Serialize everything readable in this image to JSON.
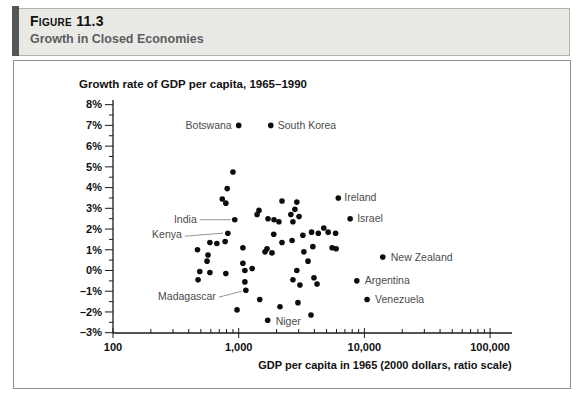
{
  "figure_header": {
    "label": "Figure 11.3",
    "title": "Growth in Closed Economies"
  },
  "colors": {
    "header_bg": "#e9e9e6",
    "header_accent": "#55565a",
    "header_title_text": "#5c5d5f",
    "frame_border": "#8f8f8f",
    "dot": "#0d0d0d",
    "country_label": "#4b4b4b",
    "leader_line": "#8a8a8a",
    "axis": "#1a1a1a"
  },
  "chart_data": {
    "type": "scatter",
    "title": "Growth rate of GDP per capita, 1965–1990",
    "xlabel": "GDP per capita in 1965 (2000 dollars, ratio scale)",
    "ylabel": "",
    "x_scale": "log",
    "xlim": [
      100,
      100000
    ],
    "ylim": [
      -3,
      8
    ],
    "grid": false,
    "x_ticks": [
      {
        "value": 100,
        "label": "100"
      },
      {
        "value": 1000,
        "label": "1,000"
      },
      {
        "value": 10000,
        "label": "10,000"
      },
      {
        "value": 100000,
        "label": "100,000"
      }
    ],
    "y_ticks": [
      {
        "value": 8,
        "label": "8%"
      },
      {
        "value": 7,
        "label": "7%"
      },
      {
        "value": 6,
        "label": "6%"
      },
      {
        "value": 5,
        "label": "5%"
      },
      {
        "value": 4,
        "label": "4%"
      },
      {
        "value": 3,
        "label": "3%"
      },
      {
        "value": 2,
        "label": "2%"
      },
      {
        "value": 1,
        "label": "1%"
      },
      {
        "value": 0,
        "label": "0%"
      },
      {
        "value": -1,
        "label": "–1%"
      },
      {
        "value": -2,
        "label": "–2%"
      },
      {
        "value": -3,
        "label": "–3%"
      }
    ],
    "y_minor_step": 0.5,
    "labeled_points": [
      {
        "label": "Botswana",
        "gdp": 1000,
        "growth": 7.0,
        "side": "left",
        "dx": -7,
        "dy": 3.5
      },
      {
        "label": "South Korea",
        "gdp": 1800,
        "growth": 7.0,
        "side": "right",
        "dx": 7,
        "dy": 3.5
      },
      {
        "label": "Ireland",
        "gdp": 6200,
        "growth": 3.5,
        "side": "right",
        "dx": 6,
        "dy": 3.5
      },
      {
        "label": "Israel",
        "gdp": 7700,
        "growth": 2.5,
        "side": "right",
        "dx": 7,
        "dy": 3.5
      },
      {
        "label": "New Zealand",
        "gdp": 14000,
        "growth": 0.65,
        "side": "right",
        "dx": 8,
        "dy": 3.5
      },
      {
        "label": "Argentina",
        "gdp": 8700,
        "growth": -0.5,
        "side": "right",
        "dx": 8,
        "dy": 3.5
      },
      {
        "label": "Venezuela",
        "gdp": 10500,
        "growth": -1.4,
        "side": "right",
        "dx": 8,
        "dy": 3.5
      },
      {
        "label": "Niger",
        "gdp": 1700,
        "growth": -2.4,
        "side": "right",
        "dx": 8,
        "dy": 5
      },
      {
        "label": "India",
        "gdp": 930,
        "growth": 2.45,
        "side": "left",
        "dx": -38,
        "dy": 3,
        "leader": [
          -35,
          0,
          -4,
          0
        ]
      },
      {
        "label": "Kenya",
        "gdp": 820,
        "growth": 1.8,
        "side": "left",
        "dx": -46,
        "dy": 5,
        "leader": [
          -43,
          3,
          -5,
          0
        ]
      },
      {
        "label": "Madagascar",
        "gdp": 1140,
        "growth": -0.95,
        "side": "left",
        "dx": -30,
        "dy": 10,
        "leader": [
          -27,
          7,
          -4,
          1
        ]
      }
    ],
    "points": [
      [
        900,
        4.75
      ],
      [
        810,
        3.95
      ],
      [
        740,
        3.45
      ],
      [
        790,
        3.25
      ],
      [
        2210,
        3.35
      ],
      [
        2900,
        3.3
      ],
      [
        1450,
        2.9
      ],
      [
        2800,
        2.95
      ],
      [
        1400,
        2.7
      ],
      [
        1710,
        2.5
      ],
      [
        1910,
        2.45
      ],
      [
        2090,
        2.35
      ],
      [
        2600,
        2.7
      ],
      [
        3020,
        2.6
      ],
      [
        2700,
        2.35
      ],
      [
        780,
        1.4
      ],
      [
        670,
        1.3
      ],
      [
        590,
        1.35
      ],
      [
        470,
        1.0
      ],
      [
        570,
        0.75
      ],
      [
        560,
        0.45
      ],
      [
        1080,
        1.1
      ],
      [
        1620,
        0.9
      ],
      [
        1840,
        0.85
      ],
      [
        1680,
        1.05
      ],
      [
        1900,
        1.75
      ],
      [
        2210,
        1.35
      ],
      [
        2660,
        1.45
      ],
      [
        3240,
        1.7
      ],
      [
        3800,
        1.85
      ],
      [
        4300,
        1.8
      ],
      [
        4750,
        2.05
      ],
      [
        5150,
        1.85
      ],
      [
        5900,
        1.8
      ],
      [
        3890,
        1.15
      ],
      [
        5540,
        1.1
      ],
      [
        5960,
        1.05
      ],
      [
        3300,
        0.9
      ],
      [
        3560,
        0.45
      ],
      [
        1280,
        0.1
      ],
      [
        1080,
        0.35
      ],
      [
        1120,
        0.0
      ],
      [
        490,
        -0.05
      ],
      [
        590,
        -0.1
      ],
      [
        790,
        -0.15
      ],
      [
        2900,
        0.0
      ],
      [
        475,
        -0.45
      ],
      [
        1120,
        -0.55
      ],
      [
        2700,
        -0.45
      ],
      [
        3070,
        -0.7
      ],
      [
        3970,
        -0.35
      ],
      [
        4200,
        -0.65
      ],
      [
        970,
        -1.9
      ],
      [
        1470,
        -1.4
      ],
      [
        2130,
        -1.75
      ],
      [
        2960,
        -1.55
      ],
      [
        3760,
        -2.15
      ]
    ]
  }
}
